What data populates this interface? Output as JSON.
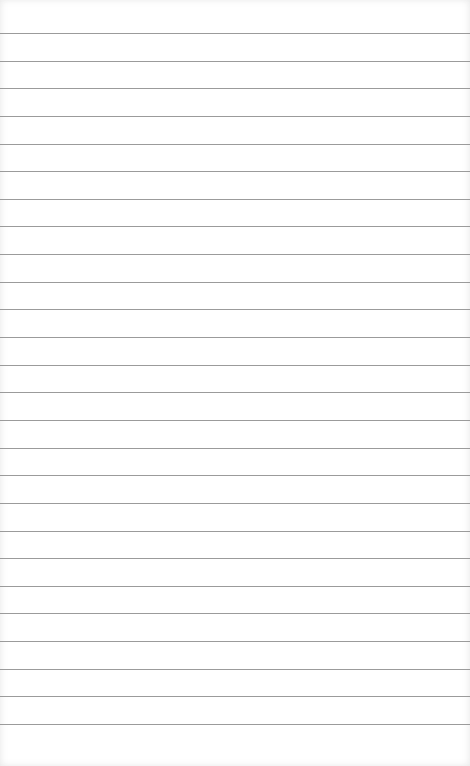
{
  "notepad": {
    "content": "",
    "line_count": 26,
    "first_line_y": 33,
    "line_spacing": 27.64,
    "line_color": "#8a8a8a",
    "paper_color": "#ffffff"
  }
}
